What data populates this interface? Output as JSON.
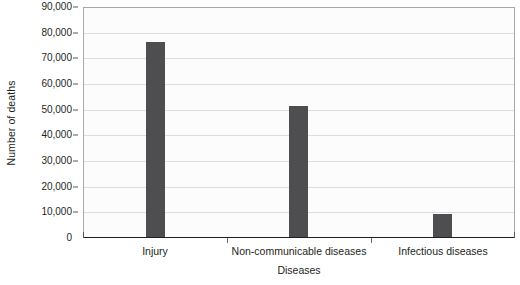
{
  "chart_data": {
    "type": "bar",
    "title": "",
    "subtitle": "",
    "categories": [
      "Injury",
      "Non-communicable diseases",
      "Infectious diseases"
    ],
    "values": [
      76000,
      51000,
      9000
    ],
    "series": [
      {
        "name": "Number of deaths",
        "values": [
          76000,
          51000,
          9000
        ]
      }
    ],
    "xlabel": "Diseases",
    "ylabel": "Number of deaths",
    "ylim": [
      0,
      90000
    ],
    "ytick_interval": 10000,
    "ytick_labels": [
      "0",
      "10,000",
      "20,000",
      "30,000",
      "40,000",
      "50,000",
      "60,000",
      "70,000",
      "80,000",
      "90,000"
    ],
    "ytick_values": [
      0,
      10000,
      20000,
      30000,
      40000,
      50000,
      60000,
      70000,
      80000,
      90000
    ],
    "grid": true,
    "grid_axis": "y",
    "legend": false,
    "legend_position": "none",
    "bar_color": "#4e4e50",
    "plot_background": "#fcfcfc",
    "gridline_color": "#dcdddf",
    "axis_color": "#231f20",
    "figure_background": "#ffffff"
  }
}
